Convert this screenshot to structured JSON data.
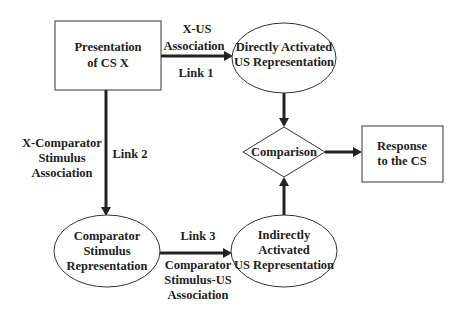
{
  "diagram": {
    "type": "flowchart",
    "colors": {
      "background": "#ffffff",
      "stroke": "#333333",
      "text": "#222222"
    },
    "nodes": {
      "cs_x": {
        "shape": "rectangle",
        "lines": [
          "Presentation",
          "of CS X"
        ]
      },
      "direct_us": {
        "shape": "ellipse",
        "lines": [
          "Directly Activated",
          "US Representation"
        ]
      },
      "comparison": {
        "shape": "diamond",
        "lines": [
          "Comparison"
        ]
      },
      "response": {
        "shape": "rectangle",
        "lines": [
          "Response",
          "to the CS"
        ]
      },
      "comparator_stim": {
        "shape": "ellipse",
        "lines": [
          "Comparator",
          "Stimulus",
          "Representation"
        ]
      },
      "indirect_us": {
        "shape": "ellipse",
        "lines": [
          "Indirectly",
          "Activated",
          "US Representation"
        ]
      }
    },
    "edges": {
      "link1": {
        "from": "cs_x",
        "to": "direct_us",
        "name": "Link 1",
        "label_lines": [
          "X-US",
          "Association"
        ]
      },
      "link2": {
        "from": "cs_x",
        "to": "comparator_stim",
        "name": "Link 2",
        "label_lines": [
          "X-Comparator",
          "Stimulus",
          "Association"
        ]
      },
      "link3": {
        "from": "comparator_stim",
        "to": "indirect_us",
        "name": "Link 3",
        "label_lines": [
          "Comparator",
          "Stimulus-US",
          "Association"
        ]
      },
      "direct_to_comparison": {
        "from": "direct_us",
        "to": "comparison"
      },
      "indirect_to_comparison": {
        "from": "indirect_us",
        "to": "comparison"
      },
      "comparison_to_response": {
        "from": "comparison",
        "to": "response"
      }
    }
  }
}
